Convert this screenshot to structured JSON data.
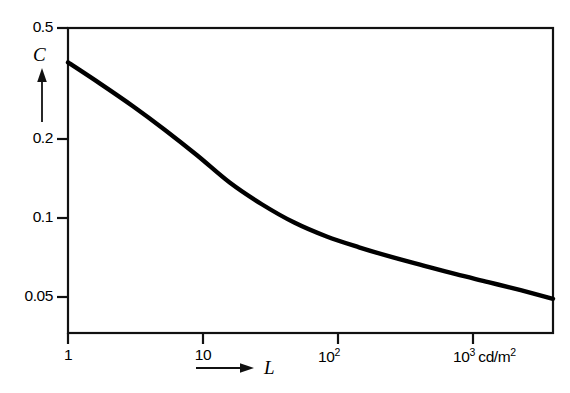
{
  "chart_data": {
    "type": "line",
    "title": "",
    "subtitle": "",
    "xlabel": "L",
    "ylabel": "C",
    "x_unit": "cd/m2",
    "xscale": "log",
    "yscale": "log",
    "xlim": [
      1,
      1000
    ],
    "ylim": [
      0.0417,
      0.5
    ],
    "grid": false,
    "legend": null,
    "x_tick_labels": [
      "1",
      "10",
      "10",
      "10"
    ],
    "x_tick_exponents": [
      "",
      "",
      "2",
      "3"
    ],
    "x_tick_values": [
      1,
      10,
      100,
      1000
    ],
    "x_last_tick_unit": "cd/m",
    "x_last_tick_unit_exponent": "2",
    "y_tick_labels": [
      "0.5",
      "0.2",
      "0.1",
      "0.05"
    ],
    "y_tick_values": [
      0.5,
      0.2,
      0.1,
      0.05
    ],
    "series": [
      {
        "name": "contrast-threshold",
        "x": [
          1,
          1.58,
          2.51,
          3.98,
          6.31,
          10,
          15.8,
          25.1,
          39.8,
          63.1,
          100,
          158,
          251,
          398,
          631,
          1000
        ],
        "values": [
          0.378,
          0.318,
          0.265,
          0.218,
          0.177,
          0.142,
          0.119,
          0.1025,
          0.0915,
          0.0838,
          0.0775,
          0.0722,
          0.0673,
          0.0631,
          0.0591,
          0.0551
        ]
      }
    ],
    "annotations": [
      {
        "name": "y-axis-arrow",
        "text": "",
        "direction": "up"
      },
      {
        "name": "x-axis-arrow",
        "text": "",
        "direction": "right"
      }
    ]
  },
  "axes": {
    "y_label": "C",
    "x_label": "L"
  }
}
